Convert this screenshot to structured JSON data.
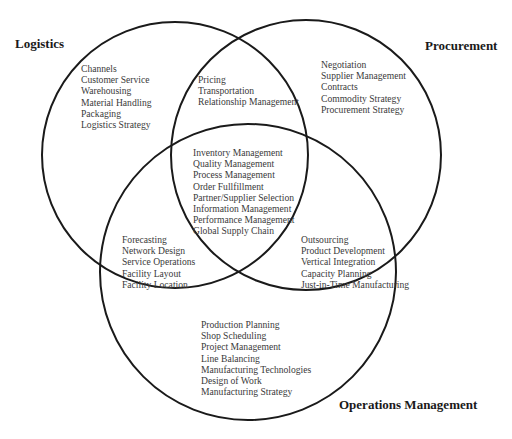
{
  "diagram": {
    "type": "venn-3",
    "circles": [
      {
        "id": "logistics",
        "title": "Logistics",
        "cx": 175,
        "cy": 155,
        "r": 133
      },
      {
        "id": "procurement",
        "title": "Procurement",
        "cx": 306,
        "cy": 155,
        "r": 135
      },
      {
        "id": "operations",
        "title": "Operations Management",
        "cx": 248,
        "cy": 272,
        "r": 148
      }
    ],
    "stroke_color": "#1a1a1a"
  },
  "titles": {
    "logistics": "Logistics",
    "procurement": "Procurement",
    "operations": "Operations Management"
  },
  "regions": {
    "logistics_only": [
      "Channels",
      "Customer Service",
      "Warehousing",
      "Material Handling",
      "Packaging",
      "Logistics Strategy"
    ],
    "logistics_procurement": [
      "Pricing",
      "Transportation",
      "Relationship Management"
    ],
    "procurement_only": [
      "Negotiation",
      "Supplier Management",
      "Contracts",
      "Commodity Strategy",
      "Procurement Strategy"
    ],
    "all_three": [
      "Inventory Management",
      "Quality Management",
      "Process Management",
      "Order Fullfillment",
      "Partner/Supplier Selection",
      "Information Management",
      "Performance Management",
      "Global Supply Chain"
    ],
    "logistics_operations": [
      "Forecasting",
      "Network Design",
      "Service Operations",
      "Facility Layout",
      "Facility Location"
    ],
    "procurement_operations": [
      "Outsourcing",
      "Product Development",
      "Vertical Integration",
      "Capacity Planning",
      "Just-in-Time Manufacturing"
    ],
    "operations_only": [
      "Production Planning",
      "Shop Scheduling",
      "Project Management",
      "Line Balancing",
      "Manufacturing Technologies",
      "Design of Work",
      "Manufacturing Strategy"
    ]
  }
}
